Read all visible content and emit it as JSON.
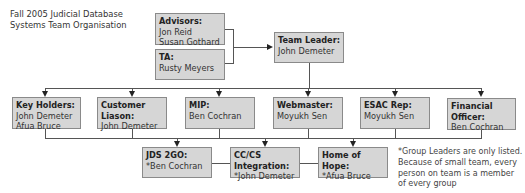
{
  "title": {
    "line1": "Fall 2005 Judicial Database",
    "line2": "Systems Team Organisation"
  },
  "advisors": {
    "heading": "Advisors:",
    "members": [
      "Jon Reid",
      "Susan Gothard"
    ]
  },
  "ta": {
    "heading": "TA:",
    "members": [
      "Rusty Meyers"
    ]
  },
  "team_leader": {
    "heading": "Team Leader:",
    "members": [
      "John Demeter"
    ]
  },
  "roles": [
    {
      "heading": "Key Holders:",
      "members": [
        "John Demeter",
        "Afua Bruce"
      ]
    },
    {
      "heading": "Customer Liason:",
      "members": [
        "John Demeter"
      ]
    },
    {
      "heading": "MIP:",
      "members": [
        "Ben Cochran"
      ]
    },
    {
      "heading": "Webmaster:",
      "members": [
        "Moyukh Sen"
      ]
    },
    {
      "heading": "ESAC Rep:",
      "members": [
        "Moyukh Sen"
      ]
    },
    {
      "heading": "Financial Officer:",
      "members": [
        "Ben Cochran"
      ]
    }
  ],
  "groups": [
    {
      "heading": "JDS 2GO:",
      "members": [
        "*Ben Cochran"
      ]
    },
    {
      "heading": "CC/CS Integration:",
      "members": [
        "*John Demeter"
      ]
    },
    {
      "heading": "Home of Hope:",
      "members": [
        "*Afua Bruce"
      ]
    }
  ],
  "footnote": "*Group Leaders are only listed. Because of small team, every person on team is a member of every group",
  "colors": {
    "box_fill": "#d6d6d6",
    "box_border": "#8a8a8a",
    "connector": "#555555"
  }
}
